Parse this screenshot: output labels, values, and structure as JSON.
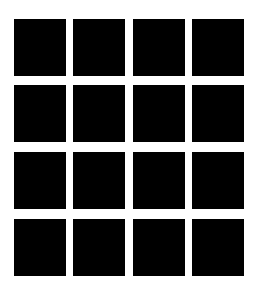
{
  "figure": {
    "type": "square-grid",
    "rows": 4,
    "cols": 4,
    "square_color": "#000000",
    "background_color": "#ffffff",
    "col_x": [
      14,
      73,
      133,
      192
    ],
    "row_y": [
      19,
      85,
      152,
      219
    ],
    "square_width": 52,
    "square_height": 57
  }
}
